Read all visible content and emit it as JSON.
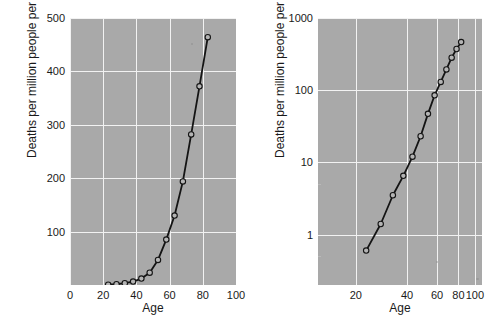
{
  "figure": {
    "background_color": "#ffffff",
    "panel_background_color": "#a9a9a9",
    "gridline_color": "#f2f2f2",
    "series_color": "#141414",
    "marker_fill_color": "#b4b4b4"
  },
  "panels": [
    {
      "id": "linear-panel",
      "xlabel": "Age",
      "ylabel": "Deaths per million people per year",
      "x_ticks": [
        "0",
        "20",
        "40",
        "60",
        "80",
        "100"
      ],
      "y_ticks": [
        "100",
        "200",
        "300",
        "400",
        "500"
      ]
    },
    {
      "id": "log-log-panel",
      "xlabel": "Age",
      "ylabel": "Deaths per million people per year",
      "x_ticks": [
        "20",
        "40",
        "60",
        "80",
        "100"
      ],
      "y_ticks": [
        "1",
        "10",
        "100",
        "1000"
      ]
    }
  ],
  "chart_data": [
    {
      "type": "line",
      "title": "",
      "xlabel": "Age",
      "ylabel": "Deaths per million people per year",
      "xscale": "linear",
      "yscale": "linear",
      "xlim": [
        0,
        100
      ],
      "ylim": [
        0,
        500
      ],
      "x_ticks": [
        0,
        20,
        40,
        60,
        80,
        100
      ],
      "y_ticks": [
        100,
        200,
        300,
        400,
        500
      ],
      "grid": true,
      "legend": "none",
      "markers": "open-circle",
      "x": [
        23,
        28,
        33,
        38,
        43,
        48,
        53,
        58,
        63,
        68,
        73,
        78,
        83
      ],
      "y": [
        0.6,
        1.4,
        3.5,
        6.5,
        12,
        23,
        47,
        85,
        130,
        194,
        282,
        372,
        464
      ]
    },
    {
      "type": "line",
      "title": "",
      "xlabel": "Age",
      "ylabel": "Deaths per million people per year",
      "xscale": "log",
      "yscale": "log",
      "xlim": [
        12,
        110
      ],
      "ylim": [
        0.2,
        1000
      ],
      "x_ticks": [
        20,
        40,
        60,
        80,
        100
      ],
      "y_ticks": [
        1,
        10,
        100,
        1000
      ],
      "grid": true,
      "legend": "none",
      "markers": "open-circle",
      "x": [
        23,
        28,
        33,
        38,
        43,
        48,
        53,
        58,
        63,
        68,
        73,
        78,
        83
      ],
      "y": [
        0.6,
        1.4,
        3.5,
        6.5,
        12,
        23,
        47,
        85,
        130,
        194,
        282,
        372,
        464
      ]
    }
  ]
}
